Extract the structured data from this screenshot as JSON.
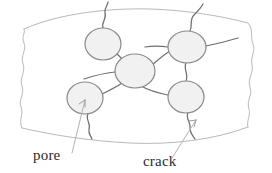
{
  "figure": {
    "type": "hand-drawn-diagram",
    "background_color": "#ffffff"
  },
  "colors": {
    "boundary_stroke": "#b9b9b9",
    "crack_stroke": "#6f6f6f",
    "pore_stroke": "#8a8a8a",
    "pore_fill": "#f1f1f1",
    "leader_stroke": "#b3b3b3",
    "label_text": "#2a2a2a"
  },
  "labels": [
    {
      "id": "pore",
      "text": "pore",
      "x": 33,
      "y": 160,
      "leader_from": [
        72,
        153
      ],
      "leader_to": [
        85,
        100
      ],
      "arrowhead": true
    },
    {
      "id": "crack",
      "text": "crack",
      "x": 143,
      "y": 166,
      "leader_from": [
        172,
        158
      ],
      "leader_to": [
        196,
        120
      ],
      "arrowhead": true
    }
  ],
  "pores": [
    {
      "id": "pore-top-left",
      "cx": 103,
      "cy": 44,
      "rx": 18,
      "ry": 16
    },
    {
      "id": "pore-center",
      "cx": 135,
      "cy": 71,
      "rx": 20,
      "ry": 17
    },
    {
      "id": "pore-top-right",
      "cx": 187,
      "cy": 47,
      "rx": 19,
      "ry": 16
    },
    {
      "id": "pore-bottom-right",
      "cx": 186,
      "cy": 97,
      "rx": 18,
      "ry": 16
    },
    {
      "id": "pore-bottom-left",
      "cx": 85,
      "cy": 98,
      "rx": 18,
      "ry": 16
    }
  ],
  "cracks": [
    {
      "id": "crack-top-left-exit",
      "description": "from top-left pore upward through top boundary"
    },
    {
      "id": "crack-topleft-to-center",
      "description": "from top-left pore down-right to center pore"
    },
    {
      "id": "crack-center-to-topright",
      "description": "from center pore up-right to top-right pore"
    },
    {
      "id": "crack-center-to-left",
      "description": "from center pore left toward left region"
    },
    {
      "id": "crack-center-to-botleft",
      "description": "from center pore down-left to bottom-left pore"
    },
    {
      "id": "crack-topright-exit",
      "description": "from top-right pore upward through top boundary"
    },
    {
      "id": "crack-topright-to-botright",
      "description": "from top-right pore down to bottom-right pore"
    },
    {
      "id": "crack-topright-left",
      "description": "from top-right pore leftward"
    },
    {
      "id": "crack-topright-right",
      "description": "from top-right pore rightward"
    },
    {
      "id": "crack-botright-left",
      "description": "from bottom-right pore leftward"
    },
    {
      "id": "crack-botright-exit",
      "description": "from bottom-right pore down through bottom boundary"
    },
    {
      "id": "crack-botleft-exit",
      "description": "from bottom-left pore down through bottom boundary"
    }
  ],
  "boundary": {
    "id": "specimen-outline",
    "description": "curved top and bottom edges with wavy torn left and right edges"
  }
}
